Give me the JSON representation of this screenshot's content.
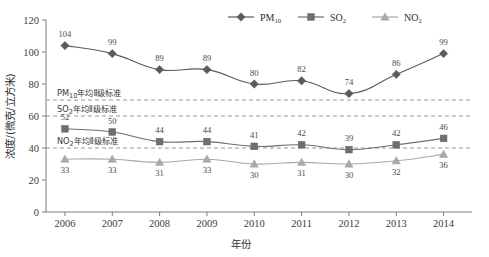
{
  "chart_data": {
    "type": "line",
    "title": "",
    "xlabel": "年份",
    "ylabel": "浓度/(微克/立方米)",
    "categories": [
      "2006",
      "2007",
      "2008",
      "2009",
      "2010",
      "2011",
      "2012",
      "2013",
      "2014"
    ],
    "x": [
      2006,
      2007,
      2008,
      2009,
      2010,
      2011,
      2012,
      2013,
      2014
    ],
    "xlim": [
      2005.6,
      2014.6
    ],
    "ylim": [
      0,
      120
    ],
    "yticks": [
      0,
      20,
      40,
      60,
      80,
      100,
      120
    ],
    "grid": false,
    "legend_position": "top-right",
    "series": [
      {
        "name": "PM10",
        "label": "PM",
        "sublabel": "10",
        "marker": "diamond",
        "color": "#5b5b5b",
        "values": [
          104,
          99,
          89,
          89,
          80,
          82,
          74,
          86,
          99
        ],
        "label_position": "above"
      },
      {
        "name": "SO2",
        "label": "SO",
        "sublabel": "2",
        "marker": "square",
        "color": "#6e6e6e",
        "values": [
          52,
          50,
          44,
          44,
          41,
          42,
          39,
          42,
          46
        ],
        "label_position": "above"
      },
      {
        "name": "NO2",
        "label": "NO",
        "sublabel": "2",
        "marker": "triangle",
        "color": "#a9a9a9",
        "values": [
          33,
          33,
          31,
          33,
          30,
          31,
          30,
          32,
          36
        ],
        "label_position": "below"
      }
    ],
    "reference_lines": [
      {
        "name": "pm10-standard",
        "value": 70,
        "label_main": "PM",
        "label_sub": "10",
        "label_rest": "年均Ⅱ级标准",
        "style": "dashed",
        "color": "#8a8a8a"
      },
      {
        "name": "so2-standard",
        "value": 60,
        "label_main": "SO",
        "label_sub": "2",
        "label_rest": "年均Ⅱ级标准",
        "style": "dashed",
        "color": "#8a8a8a"
      },
      {
        "name": "no2-standard",
        "value": 40,
        "label_main": "NO",
        "label_sub": "2",
        "label_rest": "年均Ⅱ级标准",
        "style": "dashed",
        "color": "#8a8a8a"
      }
    ]
  },
  "axis": {
    "y_label": "浓度/(微克/立方米)",
    "x_label": "年份",
    "y_tick_0": "0",
    "y_tick_20": "20",
    "y_tick_40": "40",
    "y_tick_60": "60",
    "y_tick_80": "80",
    "y_tick_100": "100",
    "y_tick_120": "120"
  },
  "colors": {
    "pm10": "#5b5b5b",
    "so2": "#6e6e6e",
    "no2": "#a9a9a9",
    "axis": "#7d7d7d",
    "reference": "#8a8a8a",
    "background": "#ffffff"
  }
}
